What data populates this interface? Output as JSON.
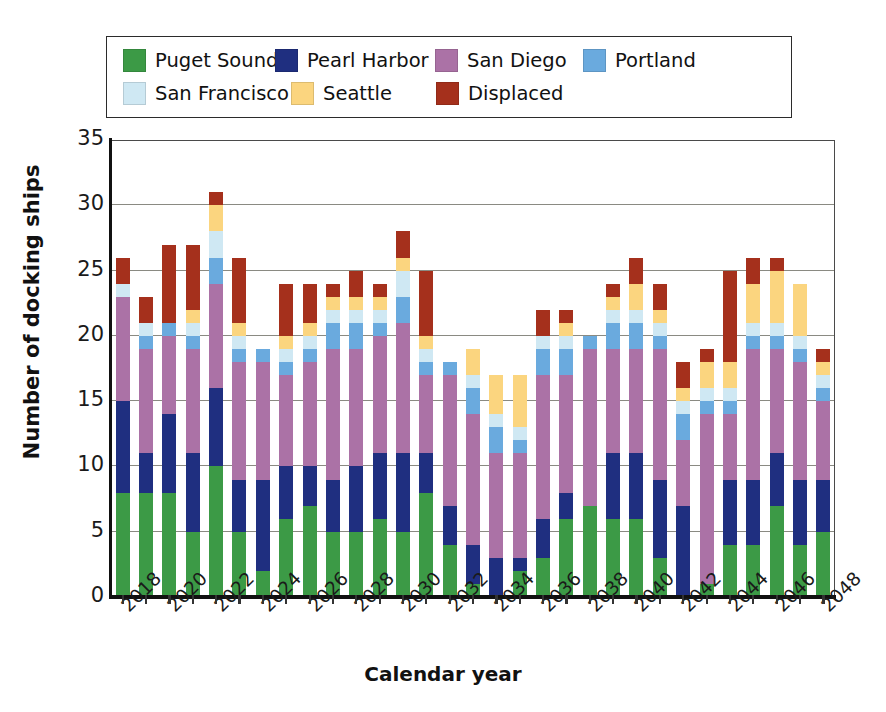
{
  "chart_data": {
    "type": "bar",
    "stacked": true,
    "title": "",
    "xlabel": "Calendar year",
    "ylabel": "Number of docking ships",
    "ylim": [
      0,
      35
    ],
    "yticks": [
      0,
      5,
      10,
      15,
      20,
      25,
      30,
      35
    ],
    "grid": true,
    "legend_position": "top",
    "x": [
      2018,
      2019,
      2020,
      2021,
      2022,
      2023,
      2024,
      2025,
      2026,
      2027,
      2028,
      2029,
      2030,
      2031,
      2032,
      2033,
      2034,
      2035,
      2036,
      2037,
      2038,
      2039,
      2040,
      2041,
      2042,
      2043,
      2044,
      2045,
      2046,
      2047,
      2048
    ],
    "tick_labels": [
      "2018",
      "2020",
      "2022",
      "2024",
      "2026",
      "2028",
      "2030",
      "2032",
      "2034",
      "2036",
      "2038",
      "2040",
      "2042",
      "2044",
      "2046",
      "2048"
    ],
    "tick_label_step": 2,
    "series": [
      {
        "name": "Puget Sound",
        "color": "#3c9a46",
        "values": [
          8,
          8,
          8,
          5,
          10,
          5,
          2,
          6,
          7,
          5,
          5,
          6,
          5,
          8,
          4,
          1,
          0,
          2,
          3,
          6,
          7,
          6,
          6,
          3,
          0,
          1,
          4,
          4,
          7,
          4,
          5
        ]
      },
      {
        "name": "Pearl Harbor",
        "color": "#1f2f80",
        "values": [
          7,
          3,
          6,
          6,
          6,
          4,
          7,
          4,
          3,
          4,
          5,
          5,
          6,
          3,
          3,
          3,
          3,
          1,
          3,
          2,
          0,
          5,
          5,
          6,
          7,
          0,
          5,
          5,
          4,
          5,
          4
        ]
      },
      {
        "name": "San Diego",
        "color": "#ab72a6",
        "values": [
          8,
          8,
          6,
          8,
          8,
          9,
          9,
          7,
          8,
          10,
          9,
          9,
          10,
          6,
          10,
          10,
          8,
          8,
          11,
          9,
          12,
          8,
          8,
          10,
          5,
          13,
          5,
          10,
          8,
          9,
          6
        ]
      },
      {
        "name": "Portland",
        "color": "#6aaade",
        "values": [
          0,
          1,
          1,
          1,
          2,
          1,
          1,
          1,
          1,
          2,
          2,
          1,
          2,
          1,
          1,
          2,
          2,
          1,
          2,
          2,
          1,
          2,
          2,
          1,
          2,
          1,
          1,
          1,
          1,
          1,
          1
        ]
      },
      {
        "name": "San Francisco",
        "color": "#cfe8f3",
        "values": [
          1,
          1,
          0,
          1,
          2,
          1,
          0,
          1,
          1,
          1,
          1,
          1,
          2,
          1,
          0,
          1,
          1,
          1,
          1,
          1,
          0,
          1,
          1,
          1,
          1,
          1,
          1,
          1,
          1,
          1,
          1
        ]
      },
      {
        "name": "Seattle",
        "color": "#fbd57f",
        "values": [
          0,
          0,
          0,
          1,
          2,
          1,
          0,
          1,
          1,
          1,
          1,
          1,
          1,
          1,
          0,
          2,
          3,
          4,
          0,
          1,
          0,
          1,
          2,
          1,
          1,
          2,
          2,
          3,
          4,
          4,
          1
        ]
      },
      {
        "name": "Displaced",
        "color": "#a5301c",
        "values": [
          2,
          2,
          6,
          5,
          1,
          5,
          0,
          4,
          3,
          1,
          2,
          1,
          2,
          5,
          0,
          0,
          0,
          0,
          2,
          1,
          0,
          1,
          2,
          2,
          2,
          1,
          7,
          2,
          1,
          0,
          1
        ]
      }
    ]
  },
  "legend": {
    "items": [
      {
        "label": "Puget Sound",
        "color": "#3c9a46"
      },
      {
        "label": "Pearl Harbor",
        "color": "#1f2f80"
      },
      {
        "label": "San Diego",
        "color": "#ab72a6"
      },
      {
        "label": "Portland",
        "color": "#6aaade"
      },
      {
        "label": "San Francisco",
        "color": "#cfe8f3"
      },
      {
        "label": "Seattle",
        "color": "#fbd57f"
      },
      {
        "label": "Displaced",
        "color": "#a5301c"
      }
    ],
    "row_breaks": [
      4,
      7
    ]
  },
  "axes": {
    "y_title": "Number of docking ships",
    "x_title": "Calendar year",
    "y_tick_labels": [
      "0",
      "5",
      "10",
      "15",
      "20",
      "25",
      "30",
      "35"
    ]
  }
}
